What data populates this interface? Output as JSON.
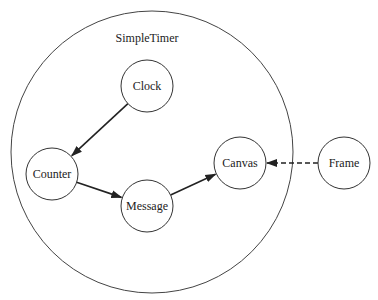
{
  "diagram": {
    "container": {
      "label": "SimpleTimer",
      "cx": 152,
      "cy": 152,
      "r": 141,
      "label_x": 147,
      "label_y": 42
    },
    "nodes": [
      {
        "id": "clock",
        "label": "Clock",
        "cx": 147,
        "cy": 86,
        "r": 26
      },
      {
        "id": "counter",
        "label": "Counter",
        "cx": 52,
        "cy": 174,
        "r": 26
      },
      {
        "id": "message",
        "label": "Message",
        "cx": 147,
        "cy": 206,
        "r": 26
      },
      {
        "id": "canvas",
        "label": "Canvas",
        "cx": 240,
        "cy": 163,
        "r": 26
      },
      {
        "id": "frame",
        "label": "Frame",
        "cx": 344,
        "cy": 163,
        "r": 26
      }
    ],
    "edges": [
      {
        "from": "clock",
        "to": "counter",
        "style": "solid"
      },
      {
        "from": "counter",
        "to": "message",
        "style": "solid"
      },
      {
        "from": "message",
        "to": "canvas",
        "style": "solid"
      },
      {
        "from": "frame",
        "to": "canvas",
        "style": "dashed"
      }
    ],
    "colors": {
      "stroke": "#222222",
      "background": "#ffffff"
    }
  }
}
